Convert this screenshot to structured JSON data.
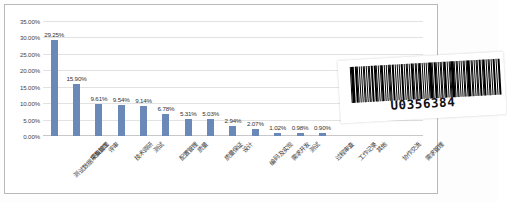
{
  "chart_data": {
    "type": "bar",
    "title": "",
    "xlabel": "",
    "ylabel": "",
    "ylim": [
      0,
      35
    ],
    "ytick_labels": [
      "0.00%",
      "5.00%",
      "10.00%",
      "15.00%",
      "20.00%",
      "25.00%",
      "30.00%",
      "35.00%"
    ],
    "ytick_values": [
      0,
      5,
      10,
      15,
      20,
      25,
      30,
      35
    ],
    "grid": true,
    "legend": false,
    "bar_color": "#6b89b8",
    "categories": [
      "测试数据采集加工",
      "项目管理",
      "评审",
      "技术调研",
      "测试",
      "配置管理",
      "质量",
      "质量保证",
      "设计",
      "编码及实现",
      "需求开发",
      "测试",
      "过程审查",
      "工作记录",
      "其他",
      "协作交流",
      "需求管理"
    ],
    "values": [
      29.25,
      15.9,
      9.61,
      9.54,
      9.14,
      6.78,
      5.31,
      5.03,
      2.94,
      2.07,
      1.02,
      0.98,
      0.9,
      0,
      0,
      0,
      0
    ],
    "data_labels": [
      "29.25%",
      "15.90%",
      "9.61%",
      "9.54%",
      "9.14%",
      "6.78%",
      "5.31%",
      "5.03%",
      "2.94%",
      "2.07%",
      "1.02%",
      "0.98%",
      "0.90%",
      "",
      "",
      "",
      ""
    ]
  },
  "barcode": {
    "value": "U0356384"
  }
}
